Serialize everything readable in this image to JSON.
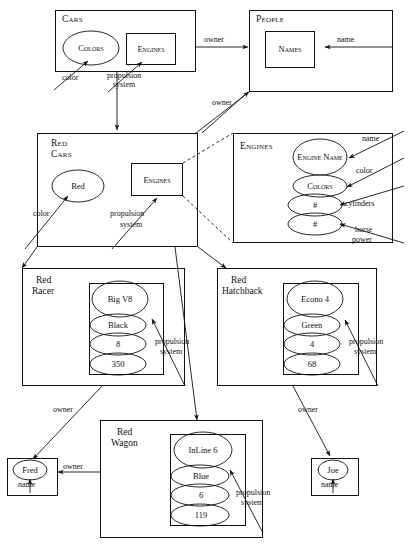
{
  "diagram": {
    "classes": {
      "cars": {
        "name": "Cars",
        "slots": [
          {
            "label": "Colors",
            "shape": "ellipse",
            "attribute": "color"
          },
          {
            "label": "Engines",
            "shape": "rectangle",
            "attribute": "propulsion system"
          }
        ],
        "relations": [
          {
            "label": "owner",
            "target": "People"
          }
        ]
      },
      "people": {
        "name": "People",
        "slots": [
          {
            "label": "Names",
            "shape": "rectangle",
            "attribute": "name"
          }
        ]
      },
      "red_cars": {
        "name_line1": "Red",
        "name_line2": "Cars",
        "slots": [
          {
            "label": "Red",
            "shape": "ellipse",
            "attribute": "color"
          },
          {
            "label": "Engines",
            "shape": "rectangle",
            "attribute": "propulsion system"
          }
        ],
        "relations": [
          {
            "label": "owner",
            "target": "People"
          }
        ]
      },
      "engines": {
        "name": "Engines",
        "slots": [
          {
            "label": "Engine Name",
            "shape": "ellipse",
            "attribute": "name"
          },
          {
            "label": "Colors",
            "shape": "ellipse",
            "attribute": "color"
          },
          {
            "label": "#",
            "shape": "ellipse",
            "attribute": "cylinders"
          },
          {
            "label": "#",
            "shape": "ellipse",
            "attribute": "horse power"
          }
        ]
      }
    },
    "instances": {
      "red_racer": {
        "name_line1": "Red",
        "name_line2": "Racer",
        "values": [
          "Big V8",
          "Black",
          "8",
          "350"
        ],
        "attribute": "propulsion system",
        "owner_label": "owner",
        "owner": "Fred"
      },
      "red_hatchback": {
        "name_line1": "Red",
        "name_line2": "Hatchback",
        "values": [
          "Econo 4",
          "Green",
          "4",
          "68"
        ],
        "attribute": "propulsion system",
        "owner_label": "owner",
        "owner": "Joe"
      },
      "red_wagon": {
        "name_line1": "Red",
        "name_line2": "Wagon",
        "values": [
          "InLine 6",
          "Blue",
          "6",
          "119"
        ],
        "attribute": "propulsion system",
        "owner_label": "owner",
        "owner": "Fred"
      },
      "fred": {
        "name": "Fred",
        "attribute": "name"
      },
      "joe": {
        "name": "Joe",
        "attribute": "name"
      }
    },
    "edge_labels": {
      "owner_cars_people": "owner",
      "name_people": "name",
      "owner_redcars_people": "owner",
      "color_cars": "color",
      "propulsion_cars_l1": "propulsion",
      "propulsion_cars_l2": "system",
      "color_redcars": "color",
      "propulsion_redcars_l1": "propulsion",
      "propulsion_redcars_l2": "system",
      "engines_name": "name",
      "engines_color": "color",
      "engines_cylinders": "cylinders",
      "engines_horse_l1": "horse",
      "engines_horse_l2": "power",
      "propulsion_racer_l1": "propulsion",
      "propulsion_racer_l2": "system",
      "propulsion_hatch_l1": "propulsion",
      "propulsion_hatch_l2": "system",
      "propulsion_wagon_l1": "propulsion",
      "propulsion_wagon_l2": "system",
      "owner_racer_fred": "owner",
      "owner_wagon_fred": "owner",
      "owner_hatch_joe": "owner",
      "name_fred": "name",
      "name_joe": "name"
    },
    "colors": {
      "ink": "#111111",
      "paper": "#ffffff"
    }
  }
}
